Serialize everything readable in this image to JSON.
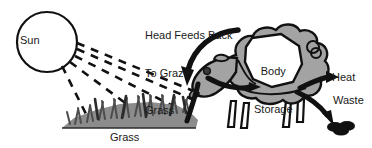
{
  "diagram": {
    "background_color": "#ffffff",
    "ink_color": "#1a1a1a",
    "body_fill_color": "#a3a3a3",
    "grass_fill_color": "#8c8c8c",
    "storage_fill_color": "#ffffff",
    "labels": {
      "sun": "Sun",
      "feedback_line1": "Head Feeds Back",
      "feedback_line2": "To Graze",
      "feedback_line3": "Grass",
      "body_storage_line1": "Body",
      "body_storage_line2": "Storage",
      "heat": "Heat",
      "waste": "Waste",
      "grass": "Grass"
    },
    "nodes": [
      {
        "name": "sun",
        "label": "Sun",
        "shape": "circle",
        "fill": "#ffffff"
      },
      {
        "name": "grass",
        "label": "Grass",
        "shape": "grass-patch",
        "fill": "#8c8c8c"
      },
      {
        "name": "sheep",
        "label": "",
        "shape": "sheep-silhouette",
        "fill": "#a3a3a3"
      },
      {
        "name": "body-storage",
        "label": "Body Storage",
        "shape": "polygon",
        "fill": "#ffffff"
      },
      {
        "name": "waste-droppings",
        "label": "",
        "shape": "oval-cluster",
        "fill": "#111111"
      }
    ],
    "flows": [
      {
        "name": "sunlight-rays",
        "from": "sun",
        "to": "grass",
        "style": "dashed",
        "label": "",
        "count": 5
      },
      {
        "name": "grass-to-sheep",
        "from": "grass",
        "to": "sheep-head",
        "style": "solid-arrow",
        "label": ""
      },
      {
        "name": "head-to-storage",
        "from": "sheep-head",
        "to": "body-storage",
        "style": "solid-arrow",
        "label": ""
      },
      {
        "name": "feedback-to-grass",
        "from": "sheep",
        "to": "grass",
        "style": "curved-arrow",
        "label": "Head Feeds Back To Graze Grass"
      },
      {
        "name": "heat-output",
        "from": "sheep",
        "to": "heat",
        "style": "solid-arrow",
        "label": "Heat"
      },
      {
        "name": "waste-output",
        "from": "sheep",
        "to": "waste-droppings",
        "style": "curved-arrow",
        "label": "Waste"
      }
    ]
  }
}
